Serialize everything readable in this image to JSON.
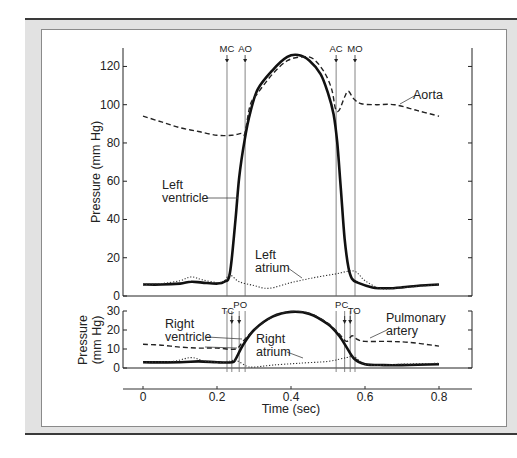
{
  "chart_data": [
    {
      "type": "line",
      "panel": "upper",
      "title": "",
      "xlabel": "Time (sec)",
      "ylabel": "Pressure (mm Hg)",
      "xlim": [
        0,
        0.8
      ],
      "ylim": [
        0,
        130
      ],
      "yticks": [
        0,
        20,
        40,
        60,
        80,
        100,
        120
      ],
      "grid": false,
      "legend": "inline annotations",
      "series": [
        {
          "name": "Left ventricle",
          "style": "solid-thick",
          "x": [
            0,
            0.05,
            0.1,
            0.13,
            0.16,
            0.2,
            0.22,
            0.235,
            0.25,
            0.26,
            0.275,
            0.29,
            0.31,
            0.35,
            0.39,
            0.42,
            0.45,
            0.48,
            0.5,
            0.515,
            0.525,
            0.535,
            0.545,
            0.555,
            0.565,
            0.58,
            0.62,
            0.66,
            0.7,
            0.75,
            0.8
          ],
          "values": [
            6,
            6,
            6.5,
            7.5,
            7,
            6.5,
            7.5,
            12,
            40,
            62,
            82,
            96,
            108,
            118,
            125,
            126,
            123,
            116,
            106,
            95,
            80,
            55,
            30,
            15,
            9,
            7,
            4.5,
            4,
            4.5,
            5.5,
            6
          ]
        },
        {
          "name": "Aorta",
          "style": "dashed",
          "x": [
            0,
            0.05,
            0.1,
            0.15,
            0.2,
            0.24,
            0.265,
            0.275,
            0.29,
            0.31,
            0.35,
            0.39,
            0.43,
            0.46,
            0.49,
            0.51,
            0.52,
            0.53,
            0.545,
            0.555,
            0.57,
            0.59,
            0.63,
            0.68,
            0.74,
            0.8
          ],
          "values": [
            94,
            91,
            88,
            86,
            84,
            84,
            85,
            85,
            100,
            106,
            116,
            123,
            125,
            124,
            117,
            108,
            98,
            97,
            104,
            107,
            103,
            100.5,
            100,
            100,
            97,
            94
          ]
        },
        {
          "name": "Left atrium",
          "style": "dotted",
          "x": [
            0,
            0.05,
            0.1,
            0.13,
            0.16,
            0.2,
            0.22,
            0.235,
            0.26,
            0.3,
            0.34,
            0.4,
            0.46,
            0.52,
            0.57,
            0.6,
            0.64,
            0.68,
            0.74,
            0.8
          ],
          "values": [
            6,
            6.5,
            8,
            10,
            8.5,
            7,
            8,
            11,
            7.5,
            5.5,
            4,
            7,
            9.5,
            11.5,
            13,
            8,
            4,
            4,
            5,
            6
          ]
        }
      ],
      "events": [
        {
          "label": "MC",
          "t": 0.227
        },
        {
          "label": "AO",
          "t": 0.276
        },
        {
          "label": "AC",
          "t": 0.522
        },
        {
          "label": "MO",
          "t": 0.573
        }
      ],
      "annotations": [
        "Aorta",
        "Left ventricle",
        "Left atrium"
      ]
    },
    {
      "type": "line",
      "panel": "lower",
      "xlabel": "Time (sec)",
      "ylabel": "Pressure (mm Hg)",
      "xlim": [
        0,
        0.8
      ],
      "ylim": [
        0,
        30
      ],
      "yticks": [
        0,
        10,
        20,
        30
      ],
      "xticks": [
        0,
        0.2,
        0.4,
        0.6,
        0.8
      ],
      "grid": false,
      "series": [
        {
          "name": "Right ventricle",
          "style": "solid-thick",
          "x": [
            0,
            0.1,
            0.15,
            0.2,
            0.24,
            0.25,
            0.27,
            0.3,
            0.35,
            0.4,
            0.45,
            0.5,
            0.53,
            0.55,
            0.57,
            0.6,
            0.65,
            0.7,
            0.8
          ],
          "values": [
            3,
            3,
            3.5,
            3,
            3,
            4.5,
            12,
            20,
            27,
            29.5,
            28.5,
            23,
            17,
            11,
            5,
            2,
            1.5,
            1.5,
            2
          ]
        },
        {
          "name": "Pulmonary artery",
          "style": "dashed",
          "x": [
            0,
            0.05,
            0.1,
            0.15,
            0.2,
            0.25,
            0.27,
            0.3,
            0.35,
            0.4,
            0.45,
            0.5,
            0.53,
            0.55,
            0.565,
            0.58,
            0.6,
            0.66,
            0.72,
            0.8
          ],
          "values": [
            12.5,
            12,
            11,
            10.5,
            10.5,
            10,
            14,
            20,
            27,
            29.7,
            28.8,
            23.5,
            18,
            14,
            17,
            15,
            14,
            14,
            13.5,
            11.5
          ]
        },
        {
          "name": "Right atrium",
          "style": "dotted",
          "x": [
            0,
            0.08,
            0.13,
            0.17,
            0.22,
            0.25,
            0.28,
            0.3,
            0.35,
            0.42,
            0.5,
            0.55,
            0.57,
            0.6,
            0.65,
            0.7,
            0.8
          ],
          "values": [
            3,
            3.5,
            5.5,
            3.5,
            3,
            4,
            1,
            0.5,
            1.5,
            2.5,
            3.5,
            5.5,
            6,
            2,
            1.5,
            2,
            2.5
          ]
        }
      ],
      "events": [
        {
          "label": "TC",
          "t": 0.24
        },
        {
          "label": "PO",
          "t": 0.26
        },
        {
          "label": "PC",
          "t": 0.545
        },
        {
          "label": "TO",
          "t": 0.56
        }
      ],
      "annotations": [
        "Right ventricle",
        "Right atrium",
        "Pulmonary artery"
      ]
    }
  ],
  "labels": {
    "upper_ylabel": "Pressure (mm Hg)",
    "lower_ylabel_line1": "Pressure",
    "lower_ylabel_line2": "(mm Hg)",
    "xlabel": "Time (sec)",
    "aorta": "Aorta",
    "lv_line1": "Left",
    "lv_line2": "ventricle",
    "la_line1": "Left",
    "la_line2": "atrium",
    "rv_line1": "Right",
    "rv_line2": "ventricle",
    "ra_line1": "Right",
    "ra_line2": "atrium",
    "pa_line1": "Pulmonary",
    "pa_line2": "artery"
  },
  "upper_yticks": [
    "0",
    "20",
    "40",
    "60",
    "80",
    "100",
    "120"
  ],
  "lower_yticks": [
    "0",
    "10",
    "20",
    "30"
  ],
  "xticks": [
    "0",
    "0.2",
    "0.4",
    "0.6",
    "0.8"
  ],
  "events_upper": [
    "MC",
    "AO",
    "AC",
    "MO"
  ],
  "events_lower": [
    "TC",
    "PO",
    "PC",
    "TO"
  ]
}
